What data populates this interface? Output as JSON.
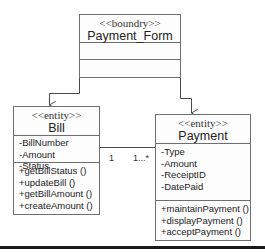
{
  "diagram": {
    "type": "UML class diagram",
    "classes": {
      "payment_form": {
        "stereotype": "<<boundry>>",
        "name": "Payment_Form",
        "attributes": [],
        "operations": []
      },
      "bill": {
        "stereotype": "<<entity>>",
        "name": "Bill",
        "attributes": [
          "-BillNumber",
          "-Amount",
          "-Status"
        ],
        "operations": [
          "+getBillStatus ()",
          "+updateBill ()",
          "+getBillAmount ()",
          "+createAmount ()"
        ]
      },
      "payment": {
        "stereotype": "<<entity>>",
        "name": "Payment",
        "attributes": [
          "-Type",
          "-Amount",
          "-ReceiptID",
          "-DatePaid"
        ],
        "operations": [
          "+maintainPayment ()",
          "+displayPayment ()",
          "+acceptPayment ()"
        ]
      }
    },
    "associations": [
      {
        "from": "Payment_Form",
        "to": "Bill",
        "kind": "directed"
      },
      {
        "from": "Payment_Form",
        "to": "Payment",
        "kind": "directed"
      },
      {
        "from": "Bill",
        "to": "Payment",
        "kind": "association",
        "multiplicity_from": "1",
        "multiplicity_to": "1...*"
      }
    ],
    "colors": {
      "line": "#4a4a4a",
      "box_border": "#6e6e6e",
      "bottom_bar": "#1a1a1a"
    }
  }
}
